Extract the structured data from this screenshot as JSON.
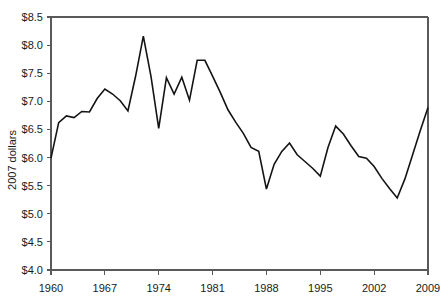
{
  "chart_data": {
    "type": "line",
    "title": "",
    "xlabel": "",
    "ylabel": "2007 dollars",
    "xlim": [
      1960,
      2009
    ],
    "ylim": [
      4.0,
      8.5
    ],
    "grid": false,
    "legend": "none",
    "y_tick_labels": [
      "$8.5",
      "$8.0",
      "$7.5",
      "$7.0",
      "$6.5",
      "$6.0",
      "$5.5",
      "$5.0",
      "$4.5",
      "$4.0"
    ],
    "y_tick_values": [
      8.5,
      8.0,
      7.5,
      7.0,
      6.5,
      6.0,
      5.5,
      5.0,
      4.5,
      4.0
    ],
    "x_tick_labels": [
      "1960",
      "1967",
      "1974",
      "1981",
      "1988",
      "1995",
      "2002",
      "2009"
    ],
    "x_tick_values": [
      1960,
      1967,
      1974,
      1981,
      1988,
      1995,
      2002,
      2009
    ],
    "series": [
      {
        "name": "2007 dollars",
        "color": "#141414",
        "x": [
          1960,
          1961,
          1962,
          1963,
          1964,
          1965,
          1966,
          1967,
          1968,
          1969,
          1970,
          1971,
          1972,
          1973,
          1974,
          1975,
          1976,
          1977,
          1978,
          1979,
          1980,
          1981,
          1982,
          1983,
          1984,
          1985,
          1986,
          1987,
          1988,
          1989,
          1990,
          1991,
          1992,
          1993,
          1994,
          1995,
          1996,
          1997,
          1998,
          1999,
          2000,
          2001,
          2002,
          2003,
          2004,
          2005,
          2006,
          2007,
          2008,
          2009
        ],
        "values": [
          5.99,
          6.62,
          6.74,
          6.71,
          6.82,
          6.81,
          7.05,
          7.22,
          7.13,
          7.01,
          6.83,
          7.45,
          8.16,
          7.44,
          6.52,
          7.42,
          7.13,
          7.43,
          7.02,
          7.73,
          7.73,
          7.45,
          7.16,
          6.85,
          6.63,
          6.43,
          6.18,
          6.11,
          5.44,
          5.88,
          6.11,
          6.26,
          6.05,
          5.93,
          5.81,
          5.67,
          6.18,
          6.56,
          6.42,
          6.21,
          6.02,
          5.99,
          5.84,
          5.63,
          5.45,
          5.28,
          5.62,
          6.05,
          6.48,
          6.89
        ]
      }
    ]
  },
  "axes": {
    "y_axis_name": "2007 dollars",
    "x_axis_name": ""
  }
}
